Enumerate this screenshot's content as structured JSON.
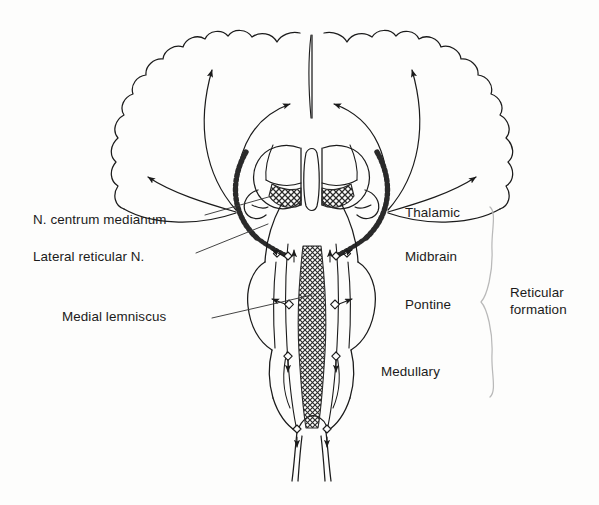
{
  "figure": {
    "background_color": "#fdfdfc",
    "ink_color": "#1b1b1b",
    "brace_color": "#b9b9b9"
  },
  "labels_left": [
    {
      "id": "n-centrum-medianum",
      "text": "N. centrum medianum",
      "x": 33,
      "y": 219
    },
    {
      "id": "lateral-reticular-n",
      "text": "Lateral reticular N.",
      "x": 33,
      "y": 256
    },
    {
      "id": "medial-lemniscus",
      "text": "Medial lemniscus",
      "x": 62,
      "y": 316
    }
  ],
  "labels_right": [
    {
      "id": "thalamic",
      "text": "Thalamic",
      "x": 405,
      "y": 212
    },
    {
      "id": "midbrain",
      "text": "Midbrain",
      "x": 405,
      "y": 256
    },
    {
      "id": "pontine",
      "text": "Pontine",
      "x": 405,
      "y": 304
    },
    {
      "id": "medullary",
      "text": "Medullary",
      "x": 381,
      "y": 371
    }
  ],
  "brace_label": {
    "id": "reticular-formation",
    "line1": "Reticular",
    "line2": "formation",
    "x": 510,
    "y": 290
  },
  "leader_lines": [
    {
      "id": "leader-centrum-medianum",
      "x1": 205,
      "y1": 215,
      "x2": 272,
      "y2": 195
    },
    {
      "id": "leader-lateral-reticular",
      "x1": 196,
      "y1": 253,
      "x2": 268,
      "y2": 224
    },
    {
      "id": "leader-medial-lemniscus",
      "x1": 212,
      "y1": 318,
      "x2": 310,
      "y2": 295
    }
  ],
  "anatomy": {
    "cortex": "cerebral-cortex-gyri-outline",
    "ventricle": "third-ventricle",
    "thalamus": "thalamic-nuclei",
    "centrum_medianum_hatch": "cross-hatched-intralaminar-nucleus",
    "raphe_column": "cross-hatched-median-reticular-column",
    "brainstem": "midbrain-pons-medulla-outline",
    "spinal_cord": "spinal-cord-taper"
  },
  "projection_arrows": [
    {
      "id": "arrow-cortex-far-left",
      "direction": "left-lateral"
    },
    {
      "id": "arrow-cortex-left",
      "direction": "left-superior"
    },
    {
      "id": "arrow-cortex-left-mid",
      "direction": "left-medial"
    },
    {
      "id": "arrow-cortex-right-mid",
      "direction": "right-medial"
    },
    {
      "id": "arrow-cortex-right",
      "direction": "right-superior"
    },
    {
      "id": "arrow-cortex-far-right",
      "direction": "right-lateral"
    }
  ]
}
